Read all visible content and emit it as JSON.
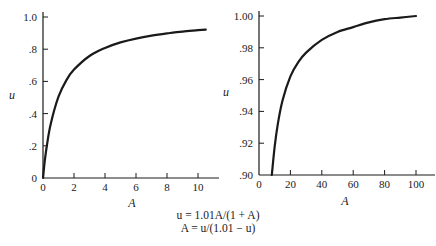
{
  "chart_data": [
    {
      "type": "line",
      "title": "",
      "xlabel": "A",
      "ylabel": "u",
      "xlim": [
        0,
        11.3
      ],
      "ylim": [
        0,
        1.05
      ],
      "grid": false,
      "x_ticks": [
        0,
        2,
        4,
        6,
        8,
        10
      ],
      "x_tick_labels": [
        "0",
        "2",
        "4",
        "6",
        "8",
        "10"
      ],
      "y_ticks": [
        0,
        0.2,
        0.4,
        0.6,
        0.8,
        1.0
      ],
      "y_tick_labels": [
        "0",
        ".2",
        ".4",
        ".6",
        ".8",
        "1.0"
      ],
      "series": [
        {
          "name": "u = 1.01A/(1 + A)",
          "x": [
            0,
            0.1,
            0.25,
            0.5,
            1,
            1.5,
            2,
            3,
            4,
            5,
            6,
            7,
            8,
            9,
            10,
            10.5
          ],
          "y": [
            0,
            0.092,
            0.202,
            0.337,
            0.505,
            0.606,
            0.673,
            0.758,
            0.808,
            0.842,
            0.866,
            0.884,
            0.898,
            0.909,
            0.918,
            0.922
          ]
        }
      ]
    },
    {
      "type": "line",
      "title": "",
      "xlabel": "A",
      "ylabel": "u",
      "xlim": [
        0,
        112
      ],
      "ylim": [
        0.9,
        1.003
      ],
      "grid": false,
      "x_ticks": [
        0,
        20,
        40,
        60,
        80,
        100
      ],
      "x_tick_labels": [
        "0",
        "20",
        "40",
        "60",
        "80",
        "100"
      ],
      "y_ticks": [
        0.9,
        0.92,
        0.94,
        0.96,
        0.98,
        1.0
      ],
      "y_tick_labels": [
        ".90",
        ".92",
        ".94",
        ".96",
        ".98",
        "1.00"
      ],
      "series": [
        {
          "name": "u = 1.01A/(1 + A)",
          "x": [
            8.18,
            10,
            12,
            15,
            20,
            25,
            30,
            40,
            50,
            60,
            70,
            80,
            90,
            100
          ],
          "y": [
            0.9,
            0.918,
            0.932,
            0.947,
            0.962,
            0.971,
            0.977,
            0.985,
            0.99,
            0.993,
            0.996,
            0.998,
            0.999,
            1.0
          ]
        }
      ]
    }
  ],
  "caption": {
    "line1": "u = 1.01A/(1 + A)",
    "line2": "A = u/(1.01 − u)"
  },
  "colors": {
    "line": "#1a1a1a",
    "background": "#ffffff"
  }
}
